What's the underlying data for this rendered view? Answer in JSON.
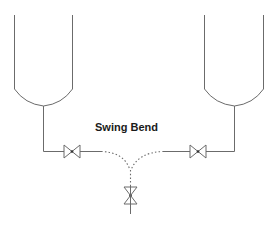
{
  "diagram": {
    "label": "Swing Bend",
    "colors": {
      "line": "#6b6b6b",
      "text": "#1a1a1a",
      "background": "#ffffff"
    },
    "components": [
      {
        "type": "tank",
        "name": "left-tank"
      },
      {
        "type": "tank",
        "name": "right-tank"
      },
      {
        "type": "valve",
        "name": "left-valve",
        "orientation": "horizontal"
      },
      {
        "type": "valve",
        "name": "right-valve",
        "orientation": "horizontal"
      },
      {
        "type": "valve",
        "name": "drain-valve",
        "orientation": "vertical"
      },
      {
        "type": "swing-bend",
        "name": "swing-bend-connection",
        "style": "dotted"
      }
    ]
  }
}
